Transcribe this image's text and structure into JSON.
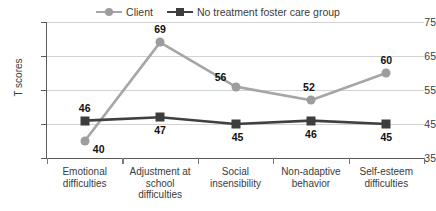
{
  "chart_data": {
    "type": "line",
    "title": "",
    "xlabel": "",
    "ylabel": "T scores",
    "ylim": [
      35,
      75
    ],
    "yticks": [
      35,
      45,
      55,
      65,
      75
    ],
    "grid": true,
    "legend_position": "top-center",
    "categories": [
      "Emotional difficulties",
      "Adjustment at school difficulties",
      "Social insensibility",
      "Non-adaptive behavior",
      "Self-esteem difficulties"
    ],
    "series": [
      {
        "name": "Client",
        "marker": "circle",
        "color": "#a6a6a6",
        "values": [
          40,
          69,
          56,
          52,
          60
        ]
      },
      {
        "name": "No treatment foster care group",
        "marker": "square",
        "color": "#404040",
        "values": [
          46,
          47,
          45,
          46,
          45
        ]
      }
    ]
  },
  "axis": {
    "y_title": "T scores",
    "y_tick_labels": [
      "75",
      "65",
      "55",
      "45",
      "35"
    ],
    "x_tick_labels_lines": [
      [
        "Emotional",
        "difficulties"
      ],
      [
        "Adjustment at",
        "school",
        "difficulties"
      ],
      [
        "Social",
        "insensibility"
      ],
      [
        "Non-adaptive",
        "behavior"
      ],
      [
        "Self-esteem",
        "difficulties"
      ]
    ]
  },
  "legend": {
    "entries": [
      {
        "label": "Client",
        "marker": "circle-marker",
        "color": "#a6a6a6"
      },
      {
        "label": "No treatment foster care group",
        "marker": "square-marker",
        "color": "#404040"
      }
    ]
  },
  "data_labels": {
    "client": [
      "40",
      "69",
      "56",
      "52",
      "60"
    ],
    "foster": [
      "46",
      "47",
      "45",
      "46",
      "45"
    ]
  },
  "colors": {
    "client_series": "#a6a6a6",
    "foster_series": "#404040",
    "gridline": "#d2d2d2",
    "axis": "#5a5a5a",
    "label_text": "#111111",
    "background": "#ffffff"
  }
}
